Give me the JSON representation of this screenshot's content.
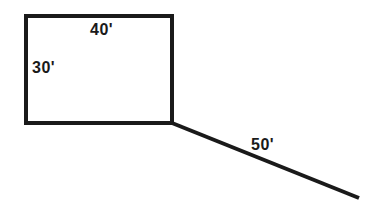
{
  "diagram": {
    "type": "dimensioned-sketch",
    "stroke_color": "#1a1a1a",
    "background": "#ffffff",
    "shapes": {
      "rectangle": {
        "x": 25,
        "y": 15,
        "width": 147,
        "height": 108,
        "stroke_width": 4,
        "width_label": "40'",
        "height_label": "30'"
      },
      "line": {
        "x1": 172,
        "y1": 123,
        "x2": 359,
        "y2": 199,
        "stroke_width": 4,
        "length_label": "50'"
      }
    },
    "labels": {
      "top": "40'",
      "left": "30'",
      "diagonal": "50'"
    }
  }
}
